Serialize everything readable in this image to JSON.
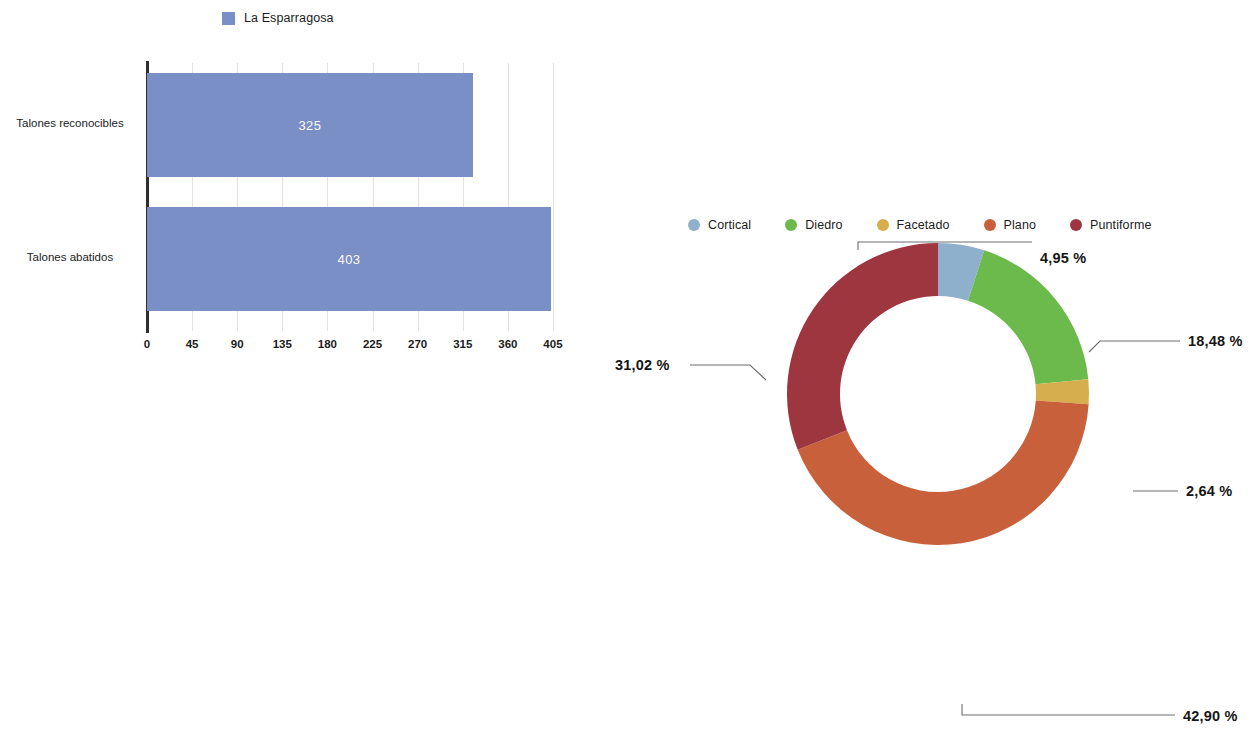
{
  "chart_data": [
    {
      "type": "bar",
      "orientation": "horizontal",
      "title": "",
      "xlabel": "",
      "ylabel": "",
      "categories": [
        "Talones reconocibles",
        "Talones abatidos"
      ],
      "values": [
        325,
        403
      ],
      "value_labels": [
        "325",
        "403"
      ],
      "series": [
        {
          "name": "La Esparragosa",
          "values": [
            325,
            403
          ],
          "color": "#7b8fc7"
        }
      ],
      "legend": {
        "position": "top",
        "entries": [
          {
            "label": "La Esparragosa",
            "color": "#7b8fc7",
            "marker": "square"
          }
        ]
      },
      "xlim": [
        0,
        427
      ],
      "xticks": [
        0,
        45,
        90,
        135,
        180,
        225,
        270,
        315,
        360,
        405
      ],
      "xtick_labels": [
        "0",
        "45",
        "90",
        "135",
        "180",
        "225",
        "270",
        "315",
        "360",
        "405"
      ],
      "grid": "vertical",
      "grid_color": "#d8d8d8",
      "axis_color": "#2e2e2e",
      "value_label_color": "#ffffff"
    },
    {
      "type": "pie",
      "subtype": "donut",
      "title": "",
      "start_angle_deg": 0,
      "direction": "clockwise",
      "labels": [
        "Cortical",
        "Diedro",
        "Facetado",
        "Plano",
        "Puntiforme"
      ],
      "values": [
        4.95,
        18.48,
        2.64,
        42.9,
        31.02
      ],
      "value_labels": [
        "4,95 %",
        "18,48 %",
        "2,64 %",
        "42,90 %",
        "31,02 %"
      ],
      "colors": [
        "#8fb0cd",
        "#6cba4b",
        "#d6ae4e",
        "#c9603c",
        "#9e3640"
      ],
      "legend": {
        "position": "top",
        "entries": [
          {
            "label": "Cortical",
            "color": "#8fb0cd",
            "marker": "circle"
          },
          {
            "label": "Diedro",
            "color": "#6cba4b",
            "marker": "circle"
          },
          {
            "label": "Facetado",
            "color": "#d6ae4e",
            "marker": "circle"
          },
          {
            "label": "Plano",
            "color": "#c9603c",
            "marker": "circle"
          },
          {
            "label": "Puntiforme",
            "color": "#9e3640",
            "marker": "circle"
          }
        ]
      },
      "callouts": [
        {
          "label": "4,95 %",
          "slice": "Cortical",
          "position": "top-right"
        },
        {
          "label": "18,48 %",
          "slice": "Diedro",
          "position": "right-upper"
        },
        {
          "label": "2,64 %",
          "slice": "Facetado",
          "position": "right-lower"
        },
        {
          "label": "42,90 %",
          "slice": "Plano",
          "position": "bottom-right"
        },
        {
          "label": "31,02 %",
          "slice": "Puntiforme",
          "position": "left"
        }
      ],
      "leader_line_color": "#6e6e6e"
    }
  ],
  "bar": {
    "legend_label": "La Esparragosa",
    "legend_color": "#7b8fc7",
    "categories": [
      {
        "label": "Talones reconocibles",
        "value_label": "325"
      },
      {
        "label": "Talones abatidos",
        "value_label": "403"
      }
    ],
    "xticks": [
      "0",
      "45",
      "90",
      "135",
      "180",
      "225",
      "270",
      "315",
      "360",
      "405"
    ]
  },
  "donut": {
    "legend": [
      {
        "label": "Cortical"
      },
      {
        "label": "Diedro"
      },
      {
        "label": "Facetado"
      },
      {
        "label": "Plano"
      },
      {
        "label": "Puntiforme"
      }
    ],
    "callouts": {
      "cortical": "4,95 %",
      "diedro": "18,48 %",
      "facetado": "2,64 %",
      "plano": "42,90 %",
      "puntiforme": "31,02 %"
    }
  }
}
